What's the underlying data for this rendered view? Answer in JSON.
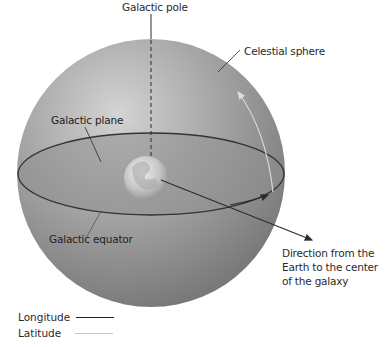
{
  "labels": {
    "galactic_pole": "Galactic pole",
    "celestial_sphere": "Celestial sphere",
    "galactic_plane": "Galactic plane",
    "galactic_equator": "Galactic equator",
    "direction": "Direction from the Earth to the center of the galaxy"
  },
  "legend": {
    "items": [
      {
        "label": "Longitude",
        "color": "#222222",
        "style": "dark"
      },
      {
        "label": "Latitude",
        "color": "#c8c8c8",
        "style": "light"
      }
    ]
  },
  "colors": {
    "sphere_light": "#c9c9c9",
    "sphere_dark": "#7c7c7c",
    "plane_fill": "#8a8a8a",
    "line_dark": "#2b2b2b",
    "line_light": "#d2d2d2"
  }
}
